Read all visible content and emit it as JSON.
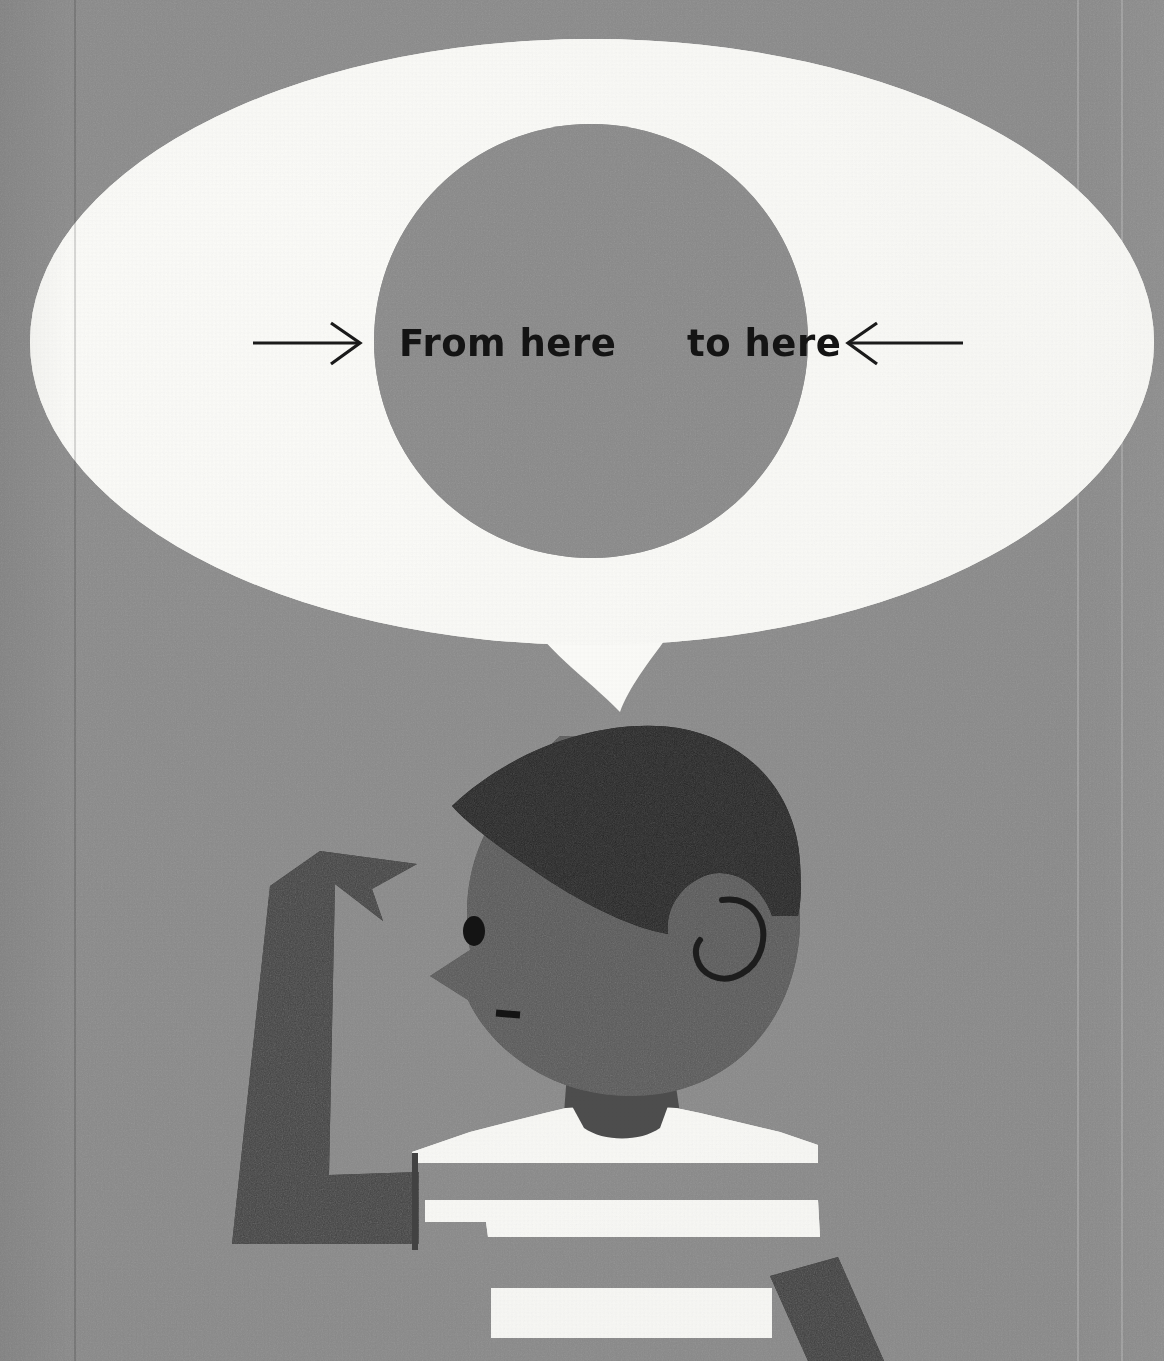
{
  "illustration": {
    "title": "From here to here",
    "description": "Mid-century style cut-paper collage of a boy in a striped shirt with a raised pointing arm, beneath a large white speech bubble containing a gray circle and the words 'From here' and 'to here' flanked by inward-pointing arrows.",
    "background_color": "#8c8c8c"
  },
  "speech_bubble": {
    "name": "speech-bubble",
    "fill": "#fbfbf8",
    "inner_circle_fill": "#8a8a8a",
    "tail": "downward-spike"
  },
  "callout": {
    "left_arrow": {
      "name": "arrow-right-icon",
      "direction": "right",
      "color": "#1a1a1a"
    },
    "right_arrow": {
      "name": "arrow-left-icon",
      "direction": "left",
      "color": "#1a1a1a"
    },
    "label_from": "From here",
    "label_to": "to here",
    "text_color": "#141414"
  },
  "figure": {
    "name": "boy-figure",
    "hair_color": "#2a2a2a",
    "skin_color": "#5a5a5a",
    "shirt_stripe_color": "#fbfbf8",
    "arm_color": "#434343",
    "parts": {
      "hair": "hair",
      "face": "face-profile",
      "eye": "eye",
      "nose": "nose",
      "mouth": "mouth",
      "ear": "ear",
      "neck": "neck",
      "shoulders": "shoulders",
      "raised_arm": "raised-arm-pointing-up",
      "lower_arm": "lower-arm",
      "stripe_1": "shirt-stripe-1",
      "stripe_2": "shirt-stripe-2",
      "stripe_3": "shirt-stripe-3"
    }
  }
}
